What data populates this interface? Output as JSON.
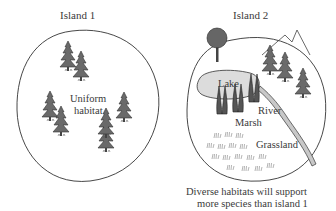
{
  "island1": {
    "title": "Island 1",
    "habitat_label_line1": "Uniform",
    "habitat_label_line2": "habitat"
  },
  "island2": {
    "title": "Island 2",
    "labels": {
      "lake": "Lake",
      "river": "River",
      "marsh": "Marsh",
      "grassland": "Grassland"
    },
    "caption_line1": "Diverse habitats will support",
    "caption_line2": "more species than island 1"
  },
  "colors": {
    "outline": "#333333",
    "lake_fill": "#dcdcdc",
    "river_fill": "#c8c8c8",
    "tree": "#555555",
    "grass": "#bdbdbd"
  }
}
